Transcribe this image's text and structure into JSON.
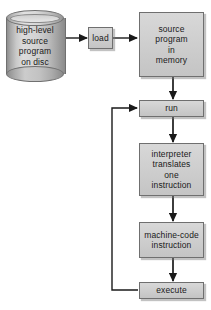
{
  "diagram": {
    "colors": {
      "box_fill": "#cfcfcf",
      "box_border": "#6f6f6f",
      "cylinder_fill": "#c4c4c4",
      "arrow": "#1a1a1a",
      "background": "#ffffff",
      "text": "#1a1a1a"
    },
    "nodes": {
      "disc": {
        "shape": "cylinder",
        "lines": [
          "high-level",
          "source",
          "program",
          "on disc"
        ]
      },
      "load": {
        "shape": "rect",
        "lines": [
          "load"
        ]
      },
      "source_memory": {
        "shape": "rect",
        "lines": [
          "source",
          "program",
          "in",
          "memory"
        ]
      },
      "run": {
        "shape": "rect",
        "lines": [
          "run"
        ]
      },
      "interpreter": {
        "shape": "rect",
        "lines": [
          "interpreter",
          "translates",
          "one",
          "instruction"
        ]
      },
      "machine_code": {
        "shape": "rect",
        "lines": [
          "machine-code",
          "instruction"
        ]
      },
      "execute": {
        "shape": "rect",
        "lines": [
          "execute"
        ]
      }
    },
    "edges": [
      {
        "from": "disc",
        "to": "load",
        "direction": "right"
      },
      {
        "from": "load",
        "to": "source_memory",
        "direction": "right"
      },
      {
        "from": "source_memory",
        "to": "run",
        "direction": "down"
      },
      {
        "from": "run",
        "to": "interpreter",
        "direction": "down"
      },
      {
        "from": "interpreter",
        "to": "machine_code",
        "direction": "down"
      },
      {
        "from": "machine_code",
        "to": "execute",
        "direction": "down"
      },
      {
        "from": "execute",
        "to": "run",
        "direction": "feedback-left-up"
      }
    ]
  }
}
